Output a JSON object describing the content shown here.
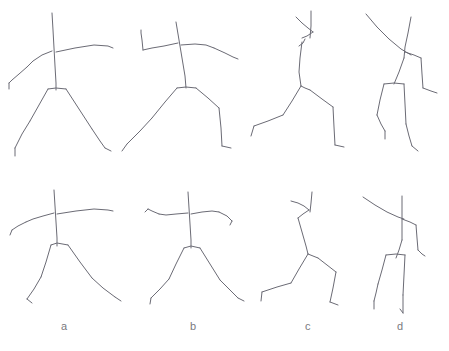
{
  "sheet": {
    "width": 449,
    "height": 351,
    "background_color": "#ffffff",
    "stroke_color": "#6b6b75",
    "stroke_width": 1,
    "description": "Line drawing sheet of eight hand-drawn stick-figure human poses arranged in two rows of four, with lowercase panel letters beneath the bottom row."
  },
  "labels": [
    {
      "text": "a",
      "x": 61,
      "y": 321
    },
    {
      "text": "b",
      "x": 190,
      "y": 321
    },
    {
      "text": "c",
      "x": 305,
      "y": 321
    },
    {
      "text": "d",
      "x": 397,
      "y": 321
    }
  ],
  "rows": [
    {
      "name": "top-row",
      "columns": [
        "a",
        "b",
        "c",
        "d"
      ]
    },
    {
      "name": "bottom-row",
      "columns": [
        "a",
        "b",
        "c",
        "d"
      ]
    }
  ],
  "figures": [
    {
      "id": "figure-top-a",
      "row": "top",
      "column": "a",
      "pose": "front-facing standing figure, arms outstretched horizontally, legs spread wide",
      "strokes": [
        {
          "name": "spine-head-axis",
          "points": "52,13 53,30 54,48 55,66 56,83 56,90"
        },
        {
          "name": "right-arm",
          "points": "56,52 75,48 94,45 108,46 113,48"
        },
        {
          "name": "left-arm-upper",
          "points": "52,51 42,55 33,61 27,67"
        },
        {
          "name": "left-forearm",
          "points": "27,67 19,74 12,80 9,83"
        },
        {
          "name": "left-hand",
          "points": "9,83 9,89"
        },
        {
          "name": "hip-bar",
          "points": "48,89 56,88 66,89"
        },
        {
          "name": "left-leg-upper",
          "points": "48,89 39,105 30,121"
        },
        {
          "name": "left-leg-lower",
          "points": "30,121 22,134 15,148"
        },
        {
          "name": "left-foot",
          "points": "15,148 15,156"
        },
        {
          "name": "right-leg-upper",
          "points": "66,89 79,109 92,129"
        },
        {
          "name": "right-leg-lower",
          "points": "92,129 100,141 105,148"
        },
        {
          "name": "right-foot",
          "points": "105,148 111,151"
        }
      ]
    },
    {
      "id": "figure-top-b",
      "row": "top",
      "column": "b",
      "pose": "front-facing figure, left arm bent upward at elbow, right arm lowered, legs in stride",
      "strokes": [
        {
          "name": "spine-head-axis",
          "points": "176,22 179,40 182,58 185,76 186,88"
        },
        {
          "name": "left-upper-arm",
          "points": "178,43 164,46 152,48 143,50"
        },
        {
          "name": "left-forearm",
          "points": "143,50 142,40 141,33 141,30"
        },
        {
          "name": "right-upper-arm",
          "points": "181,45 195,44 206,45 214,48"
        },
        {
          "name": "right-forearm",
          "points": "214,48 225,53 233,57 238,59"
        },
        {
          "name": "hip-bar",
          "points": "177,88 186,87 196,88"
        },
        {
          "name": "left-leg-upper",
          "points": "177,88 165,102 152,118"
        },
        {
          "name": "left-leg-lower",
          "points": "152,118 140,131 127,144"
        },
        {
          "name": "left-foot",
          "points": "127,144 122,151"
        },
        {
          "name": "right-leg-upper",
          "points": "196,88 208,98 219,108"
        },
        {
          "name": "right-leg-lower",
          "points": "219,108 221,128 222,146"
        },
        {
          "name": "right-foot",
          "points": "222,146 231,148"
        }
      ]
    },
    {
      "id": "figure-top-c",
      "row": "top",
      "column": "c",
      "pose": "side-view figure leaning forward, arm raised overhead, one leg extended back",
      "strokes": [
        {
          "name": "head-axis",
          "points": "311,11 311,26 310,38"
        },
        {
          "name": "raised-arm-upper",
          "points": "296,17 302,23 308,28 313,32"
        },
        {
          "name": "raised-arm-lower",
          "points": "313,32 307,36 302,38"
        },
        {
          "name": "torso",
          "points": "302,42 300,58 299,72 301,86"
        },
        {
          "name": "torso-arrowhead",
          "points": "299,46 303,43 305,39"
        },
        {
          "name": "hip-joint",
          "points": "301,86 305,88 310,90"
        },
        {
          "name": "back-leg-upper",
          "points": "301,86 292,101 283,115"
        },
        {
          "name": "back-leg-lower",
          "points": "283,115 268,121 254,126"
        },
        {
          "name": "back-foot",
          "points": "254,126 251,136"
        },
        {
          "name": "front-leg-upper",
          "points": "310,90 322,99 333,107"
        },
        {
          "name": "front-leg-lower",
          "points": "333,107 334,127 335,145"
        },
        {
          "name": "front-foot",
          "points": "335,145 344,147"
        }
      ]
    },
    {
      "id": "figure-top-d",
      "row": "top",
      "column": "d",
      "pose": "figure viewed from rear with a long arm sweeping across the body, legs close together",
      "strokes": [
        {
          "name": "head-axis",
          "points": "411,17 408,33 405,47 404,58"
        },
        {
          "name": "sweeping-arm",
          "points": "366,14 377,27 389,39 401,49 411,55"
        },
        {
          "name": "far-arm-upper",
          "points": "405,52 414,55 421,58"
        },
        {
          "name": "far-arm-lower",
          "points": "421,58 422,74 423,88"
        },
        {
          "name": "far-hand",
          "points": "423,88 431,91 437,93"
        },
        {
          "name": "torso-lower",
          "points": "404,58 399,72 394,84"
        },
        {
          "name": "hip-bar",
          "points": "384,84 394,83 404,84"
        },
        {
          "name": "left-leg-upper",
          "points": "384,84 380,100 377,115"
        },
        {
          "name": "left-leg-lower",
          "points": "377,115 381,124 385,131"
        },
        {
          "name": "left-foot",
          "points": "385,131 385,139"
        },
        {
          "name": "right-leg-upper",
          "points": "404,84 405,104 406,124"
        },
        {
          "name": "right-leg-lower",
          "points": "406,124 409,136 412,146"
        },
        {
          "name": "right-foot",
          "points": "412,146 418,151"
        }
      ]
    },
    {
      "id": "figure-bottom-a",
      "row": "bottom",
      "column": "a",
      "pose": "front-facing standing figure, arms outstretched horizontally, legs spread in a wide stance",
      "strokes": [
        {
          "name": "spine-head-axis",
          "points": "54,190 55,206 56,222 57,238 57,246"
        },
        {
          "name": "right-arm",
          "points": "57,214 76,211 94,209 108,210 113,211"
        },
        {
          "name": "left-arm-upper",
          "points": "54,213 43,216 33,219 26,222"
        },
        {
          "name": "left-forearm",
          "points": "26,222 18,226 12,230"
        },
        {
          "name": "left-hand",
          "points": "12,230 10,235"
        },
        {
          "name": "hip-bar",
          "points": "51,245 57,243 68,245"
        },
        {
          "name": "left-leg-upper",
          "points": "51,245 46,262 41,277"
        },
        {
          "name": "left-leg-lower",
          "points": "41,277 34,289 27,299"
        },
        {
          "name": "left-foot",
          "points": "27,299 32,303"
        },
        {
          "name": "right-leg-upper",
          "points": "68,245 80,262 92,278"
        },
        {
          "name": "right-leg-lower",
          "points": "92,278 103,288 115,297"
        },
        {
          "name": "right-foot",
          "points": "115,297 121,301"
        }
      ]
    },
    {
      "id": "figure-bottom-b",
      "row": "bottom",
      "column": "b",
      "pose": "front-facing figure with both arms out and slightly drooping, legs spread in stride",
      "strokes": [
        {
          "name": "spine-head-axis",
          "points": "188,192 189,208 190,224 191,240 191,248"
        },
        {
          "name": "left-upper-arm",
          "points": "188,213 176,214 166,215 159,214"
        },
        {
          "name": "left-forearm",
          "points": "159,214 152,211 148,209"
        },
        {
          "name": "left-hand",
          "points": "148,209 145,212"
        },
        {
          "name": "right-upper-arm",
          "points": "191,214 202,212 212,211 219,212"
        },
        {
          "name": "right-forearm",
          "points": "219,212 227,216 232,221"
        },
        {
          "name": "right-hand",
          "points": "232,221 230,225"
        },
        {
          "name": "hip-bar",
          "points": "184,248 191,246 200,248"
        },
        {
          "name": "left-leg-upper",
          "points": "184,248 176,264 169,279"
        },
        {
          "name": "left-leg-lower",
          "points": "169,279 160,289 151,298"
        },
        {
          "name": "left-foot",
          "points": "151,298 150,304"
        },
        {
          "name": "right-leg-upper",
          "points": "200,248 210,264 220,280"
        },
        {
          "name": "right-leg-lower",
          "points": "220,280 229,289 238,298"
        },
        {
          "name": "right-foot",
          "points": "238,298 244,301"
        }
      ]
    },
    {
      "id": "figure-bottom-c",
      "row": "bottom",
      "column": "c",
      "pose": "side-view figure crouched forward, arm bent and raised, legs in a deep lunge",
      "strokes": [
        {
          "name": "head-axis",
          "points": "312,192 311,203 310,212"
        },
        {
          "name": "raised-arm-upper",
          "points": "291,201 298,203 304,206 309,210"
        },
        {
          "name": "raised-arm-lower",
          "points": "309,210 303,214 298,218"
        },
        {
          "name": "torso",
          "points": "298,218 302,232 306,246 308,254"
        },
        {
          "name": "hip-joint",
          "points": "308,254 313,256 318,258"
        },
        {
          "name": "back-leg-upper",
          "points": "308,254 299,269 291,283"
        },
        {
          "name": "back-leg-lower",
          "points": "291,283 277,287 262,292"
        },
        {
          "name": "back-foot",
          "points": "262,292 261,301"
        },
        {
          "name": "front-leg-upper",
          "points": "318,258 327,265 336,272"
        },
        {
          "name": "front-leg-lower",
          "points": "336,272 333,288 330,302"
        },
        {
          "name": "front-foot",
          "points": "330,302 338,305"
        }
      ]
    },
    {
      "id": "figure-bottom-d",
      "row": "bottom",
      "column": "d",
      "pose": "rear-view figure with an arm sweeping across, legs together and nearly vertical",
      "strokes": [
        {
          "name": "head-axis",
          "points": "402,196 402,212 402,228 402,240"
        },
        {
          "name": "sweeping-arm",
          "points": "363,197 375,205 387,212 398,217 404,219"
        },
        {
          "name": "far-arm-upper",
          "points": "402,219 410,222 416,225"
        },
        {
          "name": "far-arm-lower",
          "points": "416,225 417,238 418,250"
        },
        {
          "name": "far-hand",
          "points": "418,250 422,254 425,256"
        },
        {
          "name": "torso-lower",
          "points": "402,240 399,250 396,258"
        },
        {
          "name": "hip-bar",
          "points": "386,255 396,254 405,255"
        },
        {
          "name": "left-leg-upper",
          "points": "386,255 382,270 378,284"
        },
        {
          "name": "left-leg-lower",
          "points": "378,284 376,293 374,301"
        },
        {
          "name": "left-foot",
          "points": "374,301 374,309"
        },
        {
          "name": "right-leg-upper",
          "points": "405,255 404,275 403,295"
        },
        {
          "name": "right-leg-lower",
          "points": "403,295 403,305 403,313"
        },
        {
          "name": "right-foot",
          "points": "403,313 400,309"
        }
      ]
    }
  ]
}
